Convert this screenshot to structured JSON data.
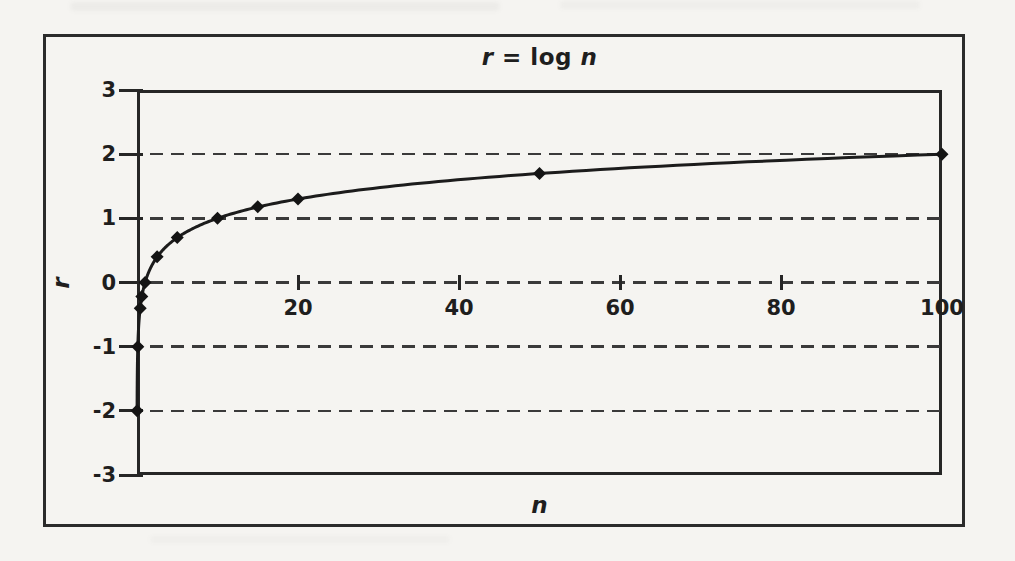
{
  "figure": {
    "title": {
      "var_r": "r",
      "middle": " = log ",
      "var_n": "n"
    },
    "x_axis_title": "n",
    "y_axis_title": "r"
  },
  "chart_data": {
    "type": "line",
    "title": "r = log n",
    "xlabel": "n",
    "ylabel": "r",
    "xlim": [
      0,
      100
    ],
    "ylim": [
      -3,
      3
    ],
    "x_ticks": [
      20,
      40,
      60,
      80,
      100
    ],
    "y_ticks": [
      3,
      2,
      1,
      0,
      -1,
      -2,
      -3
    ],
    "grid": {
      "horizontal_dashed_at": [
        2,
        1,
        0,
        -1,
        -2
      ],
      "vertical": "off"
    },
    "legend": "none",
    "series": [
      {
        "name": "r = log n",
        "color": "#1c1c1c",
        "marker": "diamond",
        "marker_color": "#141414",
        "points": [
          {
            "n": 0.01,
            "r": -2
          },
          {
            "n": 0.1,
            "r": -1
          },
          {
            "n": 0.4,
            "r": -0.4
          },
          {
            "n": 0.6,
            "r": -0.22
          },
          {
            "n": 1,
            "r": 0
          },
          {
            "n": 2.5,
            "r": 0.4
          },
          {
            "n": 5,
            "r": 0.7
          },
          {
            "n": 10,
            "r": 1
          },
          {
            "n": 15,
            "r": 1.18
          },
          {
            "n": 20,
            "r": 1.3
          },
          {
            "n": 50,
            "r": 1.7
          },
          {
            "n": 100,
            "r": 2
          }
        ]
      }
    ]
  },
  "colors": {
    "background": "#f5f4f1",
    "frame": "#2b2b2b",
    "axis": "#262626",
    "gridline": "#3a3a3a",
    "text": "#1e1e1e"
  }
}
